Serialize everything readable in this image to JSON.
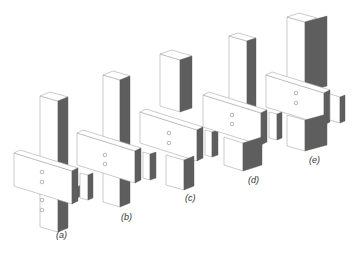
{
  "figure": {
    "colors": {
      "background": "#ffffff",
      "outline": "#a8a8a8",
      "shaded_face": "#5e5e5e"
    },
    "panels": [
      {
        "id": "a",
        "label": "(a)",
        "bolts_upper": 2,
        "bolts_lower": 2
      },
      {
        "id": "b",
        "label": "(b)",
        "bolts_upper": 2,
        "bolts_lower": 0
      },
      {
        "id": "c",
        "label": "(c)",
        "bolts_upper": 2,
        "bolts_lower": 0
      },
      {
        "id": "d",
        "label": "(d)",
        "bolts_upper": 2,
        "bolts_lower": 0
      },
      {
        "id": "e",
        "label": "(e)",
        "bolts_upper": 2,
        "bolts_lower": 0
      }
    ]
  }
}
